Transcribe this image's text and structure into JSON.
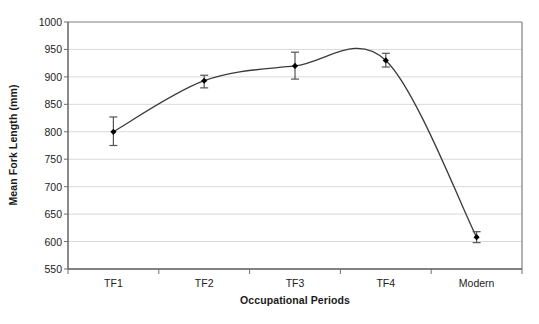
{
  "chart_data": {
    "type": "line",
    "title": "",
    "xlabel": "Occupational Periods",
    "ylabel": "Mean Fork Length (mm)",
    "categories": [
      "TF1",
      "TF2",
      "TF3",
      "TF4",
      "Modern"
    ],
    "values": [
      800,
      893,
      920,
      930,
      608
    ],
    "error_low": [
      775,
      880,
      896,
      918,
      598
    ],
    "error_high": [
      827,
      903,
      945,
      943,
      618
    ],
    "yticks": [
      550,
      600,
      650,
      700,
      750,
      800,
      850,
      900,
      950,
      1000
    ],
    "ylim": [
      550,
      1000
    ],
    "ytick_labels": [
      "550",
      "600",
      "650",
      "700",
      "750",
      "800",
      "850",
      "900",
      "950",
      "1000"
    ],
    "grid": true,
    "legend": "none",
    "series": [
      {
        "name": "Mean Fork Length",
        "values": [
          800,
          893,
          920,
          930,
          608
        ],
        "marker": "filled-diamond",
        "line_style": "smooth-curve",
        "color": "#333333"
      }
    ],
    "annotations": {
      "curve_peak_value": 953,
      "curve_peak_between": "TF3-TF4"
    },
    "colors": {
      "line": "#3a3a3a",
      "marker": "#000000",
      "error_bar": "#555555",
      "grid": "#d9d9d9",
      "axis": "#7f7f7f",
      "background": "#ffffff",
      "text": "#222222"
    }
  },
  "layout": {
    "plot_left": 68,
    "plot_top": 22,
    "plot_right": 522,
    "plot_bottom": 269,
    "xlabel_top": 294
  }
}
